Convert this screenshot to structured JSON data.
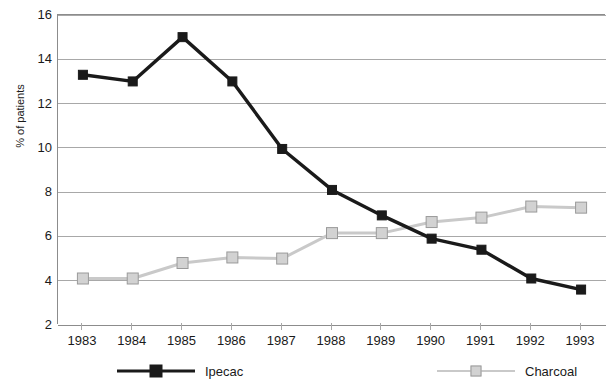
{
  "chart_data": {
    "type": "line",
    "title": "",
    "xlabel": "",
    "ylabel": "% of patients",
    "categories": [
      "1983",
      "1984",
      "1985",
      "1986",
      "1987",
      "1988",
      "1989",
      "1990",
      "1991",
      "1992",
      "1993"
    ],
    "ylim": [
      2,
      16
    ],
    "y_ticks": [
      16,
      14,
      12,
      10,
      8,
      6,
      4,
      2
    ],
    "grid": true,
    "legend_position": "bottom",
    "series": [
      {
        "name": "Ipecac",
        "color": "#1a1a1a",
        "marker": "filled-square",
        "values": [
          13.3,
          13.0,
          15.0,
          13.0,
          9.95,
          8.1,
          6.95,
          5.9,
          5.4,
          4.1,
          3.6
        ]
      },
      {
        "name": "Charcoal",
        "color": "#c9c9c9",
        "marker": "open-square",
        "values": [
          4.1,
          4.1,
          4.8,
          5.05,
          5.0,
          6.15,
          6.15,
          6.65,
          6.85,
          7.35,
          7.3
        ]
      }
    ]
  },
  "axis": {
    "y_tick_labels": [
      "16",
      "14",
      "12",
      "10",
      "8",
      "6",
      "4",
      "2"
    ],
    "y_title": "% of patients",
    "x_tick_labels": [
      "1983",
      "1984",
      "1985",
      "1986",
      "1987",
      "1988",
      "1989",
      "1990",
      "1991",
      "1992",
      "1993"
    ]
  },
  "legend": {
    "entries": [
      {
        "label": "Ipecac",
        "color": "#1a1a1a",
        "marker": "filled-square"
      },
      {
        "label": "Charcoal",
        "color": "#c9c9c9",
        "marker": "open-square"
      }
    ]
  },
  "colors": {
    "ipecac": "#1a1a1a",
    "charcoal": "#c9c9c9",
    "grid": "#a8a8a8",
    "axis": "#8c8c8c",
    "background": "#ffffff",
    "text": "#1a1a1a"
  }
}
